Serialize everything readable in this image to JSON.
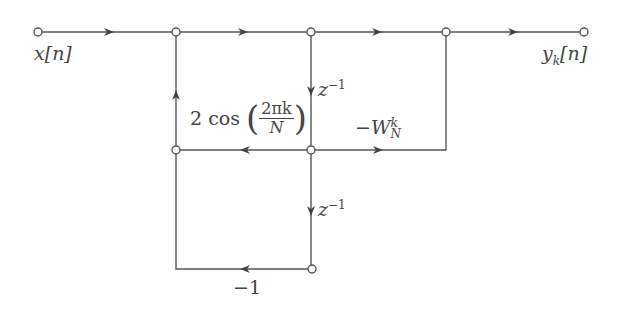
{
  "diagram": {
    "input_label": "x[n]",
    "output_label": "y_k[n]",
    "labels": {
      "input": {
        "var": "x",
        "idx": "[n]"
      },
      "output": {
        "var": "y",
        "sub": "k",
        "idx": "[n]"
      },
      "delay1": {
        "base": "z",
        "exp": "−1"
      },
      "delay2": {
        "base": "z",
        "exp": "−1"
      },
      "cos_gain": {
        "coef": "2 cos",
        "num": "2πk",
        "den": "N"
      },
      "twiddle": {
        "sign": "−",
        "base": "W",
        "sup": "k",
        "sub": "N"
      },
      "minus_one": "−1"
    },
    "nodes": [
      {
        "id": "in",
        "x": 38,
        "y": 32
      },
      {
        "id": "n1",
        "x": 176,
        "y": 32
      },
      {
        "id": "n2",
        "x": 311,
        "y": 32
      },
      {
        "id": "n3",
        "x": 446,
        "y": 32
      },
      {
        "id": "out",
        "x": 584,
        "y": 32
      },
      {
        "id": "m1",
        "x": 176,
        "y": 150
      },
      {
        "id": "m2",
        "x": 311,
        "y": 150
      },
      {
        "id": "b2",
        "x": 312,
        "y": 269
      }
    ],
    "colors": {
      "line": "#444444",
      "text": "#444444",
      "background": "#ffffff"
    }
  }
}
